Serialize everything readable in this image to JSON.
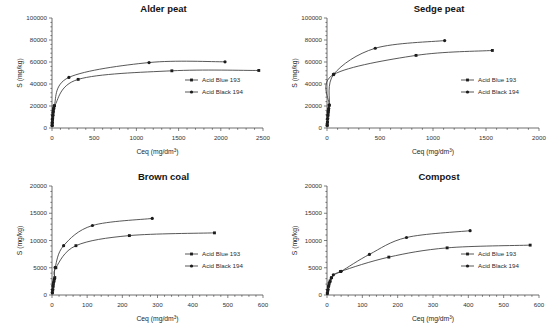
{
  "figure": {
    "series_names": [
      "Acid Blue 193",
      "Acid Black 194"
    ],
    "markers": [
      "square-marker",
      "circle-marker"
    ],
    "xlabel": "Ceq (mg/dm",
    "xlabel_sup": "3",
    "xlabel_close": ")",
    "ylabel": "S (mg/kg)"
  },
  "chart_data": [
    {
      "type": "scatter",
      "title": "Alder peat",
      "xlabel": "Ceq (mg/dm3)",
      "ylabel": "S (mg/kg)",
      "xlim": [
        0,
        2500
      ],
      "ylim": [
        0,
        100000
      ],
      "xticks": [
        0,
        500,
        1000,
        1500,
        2000,
        2500
      ],
      "yticks": [
        0,
        20000,
        40000,
        60000,
        80000,
        100000
      ],
      "grid": false,
      "legend_position": "center-right",
      "series": [
        {
          "name": "Acid Blue 193",
          "marker": "square",
          "x": [
            2,
            4,
            6,
            9,
            12,
            16,
            22,
            30,
            310,
            1420,
            2450
          ],
          "y": [
            2200,
            4800,
            7600,
            10500,
            13200,
            15800,
            18200,
            20300,
            44200,
            52000,
            52300
          ]
        },
        {
          "name": "Acid Black 194",
          "marker": "circle",
          "x": [
            2,
            4,
            7,
            10,
            14,
            19,
            25,
            200,
            1150,
            2050
          ],
          "y": [
            2500,
            5200,
            8400,
            11500,
            14600,
            17400,
            20200,
            46000,
            59500,
            60200
          ]
        }
      ]
    },
    {
      "type": "scatter",
      "title": "Sedge peat",
      "xlabel": "Ceq (mg/dm3)",
      "ylabel": "S (mg/kg)",
      "xlim": [
        0,
        2000
      ],
      "ylim": [
        0,
        100000
      ],
      "xticks": [
        0,
        500,
        1000,
        1500,
        2000
      ],
      "yticks": [
        0,
        20000,
        40000,
        60000,
        80000,
        100000
      ],
      "grid": false,
      "legend_position": "center-right",
      "series": [
        {
          "name": "Acid Blue 193",
          "marker": "square",
          "x": [
            2,
            4,
            6,
            8,
            11,
            15,
            20,
            60,
            840,
            1560
          ],
          "y": [
            2400,
            5100,
            8000,
            11000,
            13800,
            16500,
            20500,
            48500,
            66000,
            70500
          ]
        },
        {
          "name": "Acid Black 194",
          "marker": "circle",
          "x": [
            2,
            4,
            6,
            9,
            12,
            16,
            22,
            65,
            455,
            1110
          ],
          "y": [
            2600,
            5400,
            8600,
            11800,
            14800,
            17800,
            21000,
            49000,
            72500,
            79500
          ]
        }
      ]
    },
    {
      "type": "scatter",
      "title": "Brown coal",
      "xlabel": "Ceq (mg/dm3)",
      "ylabel": "S (mg/kg)",
      "xlim": [
        0,
        600
      ],
      "ylim": [
        0,
        20000
      ],
      "xticks": [
        0,
        100,
        200,
        300,
        400,
        500,
        600
      ],
      "yticks": [
        0,
        5000,
        10000,
        15000,
        20000
      ],
      "grid": false,
      "legend_position": "center-right",
      "series": [
        {
          "name": "Acid Blue 193",
          "marker": "square",
          "x": [
            1,
            2,
            3,
            4,
            6,
            8,
            11,
            68,
            220,
            462
          ],
          "y": [
            400,
            900,
            1500,
            2100,
            2700,
            3200,
            5000,
            9050,
            10900,
            11400
          ]
        },
        {
          "name": "Acid Black 194",
          "marker": "circle",
          "x": [
            1,
            2,
            3,
            5,
            7,
            9,
            33,
            115,
            285
          ],
          "y": [
            450,
            1000,
            1700,
            2400,
            3000,
            5050,
            9050,
            12750,
            14050
          ]
        }
      ]
    },
    {
      "type": "scatter",
      "title": "Compost",
      "xlabel": "Ceq (mg/dm3)",
      "ylabel": "S (mg/kg)",
      "xlim": [
        0,
        600
      ],
      "ylim": [
        0,
        20000
      ],
      "xticks": [
        0,
        100,
        200,
        300,
        400,
        500,
        600
      ],
      "yticks": [
        0,
        5000,
        10000,
        15000,
        20000
      ],
      "grid": false,
      "legend_position": "center-right",
      "series": [
        {
          "name": "Acid Blue 193",
          "marker": "square",
          "x": [
            1,
            2,
            4,
            6,
            9,
            13,
            38,
            175,
            340,
            575
          ],
          "y": [
            300,
            800,
            1500,
            2100,
            2600,
            3200,
            4300,
            6950,
            8650,
            9150
          ]
        },
        {
          "name": "Acid Black 194",
          "marker": "circle",
          "x": [
            1,
            3,
            5,
            8,
            12,
            18,
            40,
            120,
            225,
            405
          ],
          "y": [
            350,
            1000,
            1700,
            2400,
            3100,
            3700,
            4350,
            7450,
            10550,
            11800
          ]
        }
      ]
    }
  ]
}
